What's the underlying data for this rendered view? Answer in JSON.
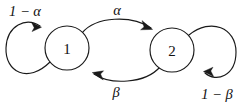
{
  "diagram": {
    "type": "state-transition-diagram",
    "background_color": "#ffffff",
    "line_color": "#1a1a1a",
    "nodes": [
      {
        "id": "state-1",
        "label": "1",
        "cx": 67,
        "cy": 48,
        "r": 22
      },
      {
        "id": "state-2",
        "label": "2",
        "cx": 172,
        "cy": 50,
        "r": 22
      }
    ],
    "edges": [
      {
        "id": "self-loop-1",
        "from": "state-1",
        "to": "state-1",
        "label": "1 − α",
        "label_prefix": "1 − ",
        "label_symbol": "α",
        "label_x": 25,
        "label_y": 11,
        "position": "left"
      },
      {
        "id": "edge-1-to-2",
        "from": "state-1",
        "to": "state-2",
        "label": "α",
        "label_prefix": "",
        "label_symbol": "α",
        "label_x": 117,
        "label_y": 10,
        "position": "top"
      },
      {
        "id": "edge-2-to-1",
        "from": "state-2",
        "to": "state-1",
        "label": "β",
        "label_prefix": "",
        "label_symbol": "β",
        "label_x": 116,
        "label_y": 92,
        "position": "bottom"
      },
      {
        "id": "self-loop-2",
        "from": "state-2",
        "to": "state-2",
        "label": "1 − β",
        "label_prefix": "1 − ",
        "label_symbol": "β",
        "label_x": 217,
        "label_y": 94,
        "position": "right"
      }
    ]
  }
}
